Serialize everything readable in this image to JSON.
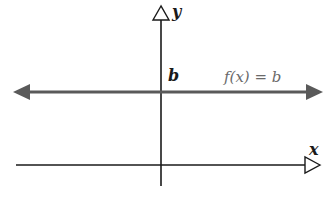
{
  "diagram": {
    "type": "graph-of-constant-function",
    "axes": {
      "x_label": "x",
      "y_label": "y"
    },
    "line": {
      "label": "f(x) = b",
      "y_intercept_label": "b",
      "color": "#5a5a5a"
    },
    "colors": {
      "axis": "#1a1a1a",
      "line": "#5a5a5a",
      "label_text": "#6a6a6a",
      "background": "#ffffff"
    }
  }
}
